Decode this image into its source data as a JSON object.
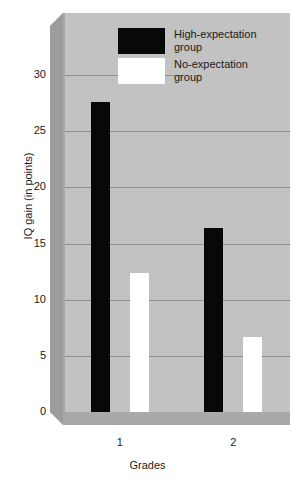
{
  "chart_data": {
    "type": "bar",
    "title": "",
    "subtitle": "",
    "xlabel": "Grades",
    "ylabel": "IQ gain (in points)",
    "categories": [
      "1",
      "2"
    ],
    "series": [
      {
        "name": "High-expectation group",
        "color": "#080808",
        "values": [
          27.6,
          16.4
        ]
      },
      {
        "name": "No-expectation group",
        "color": "#ffffff",
        "values": [
          12.4,
          6.7
        ]
      }
    ],
    "ylim": [
      0,
      30
    ],
    "ytick_values": [
      0,
      5,
      10,
      15,
      20,
      25,
      30
    ],
    "ytick_labels": [
      "0",
      "5",
      "10",
      "15",
      "20",
      "25",
      "30"
    ],
    "xtick_labels": [
      "1",
      "2"
    ],
    "grid": "horizontal",
    "legend_position": "top-center",
    "panel_color": "#c2c2c2",
    "grid_color": "#8f8f8f",
    "background": "#ffffff"
  },
  "legend": {
    "entries": [
      {
        "label_line1": "High-expectation",
        "label_line2": "group",
        "swatch": "black-swatch"
      },
      {
        "label_line1": "No-expectation",
        "label_line2": "group",
        "swatch": "white-swatch"
      }
    ]
  },
  "axes": {
    "y_title": "IQ gain (in points)",
    "x_title": "Grades",
    "y_ticks": [
      "30",
      "25",
      "20",
      "15",
      "10",
      "5",
      "0"
    ],
    "x_ticks": [
      "1",
      "2"
    ]
  }
}
